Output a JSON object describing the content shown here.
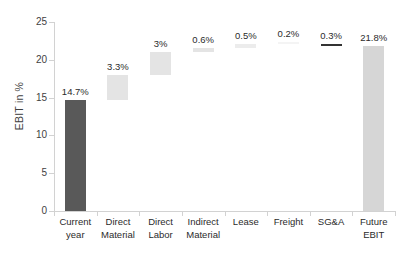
{
  "chart_data": {
    "type": "bar",
    "subtype": "waterfall",
    "title": "",
    "xlabel": "",
    "ylabel": "EBIT in %",
    "ylim": [
      0,
      25
    ],
    "yticks": [
      0,
      5,
      10,
      15,
      20,
      25
    ],
    "ytick_labels": [
      "0",
      "5",
      "10",
      "15",
      "20",
      "25"
    ],
    "grid": false,
    "legend": "none",
    "categories": [
      "Current year",
      "Direct Material",
      "Direct Labor",
      "Indirect Material",
      "Lease",
      "Freight",
      "SG&A",
      "Future EBIT"
    ],
    "category_lines": [
      [
        "Current",
        "year"
      ],
      [
        "Direct",
        "Material"
      ],
      [
        "Direct",
        "Labor"
      ],
      [
        "Indirect",
        "Material"
      ],
      [
        "Lease"
      ],
      [
        "Freight"
      ],
      [
        "SG&A"
      ],
      [
        "Future",
        "EBIT"
      ]
    ],
    "data_labels": [
      "14.7%",
      "3.3%",
      "3%",
      "0.6%",
      "0.5%",
      "0.2%",
      "0.3%",
      "21.8%"
    ],
    "values": [
      14.7,
      3.3,
      3.0,
      0.6,
      0.5,
      0.2,
      -0.3,
      21.8
    ],
    "bars": [
      {
        "category": "Current year",
        "label": "14.7%",
        "value": 14.7,
        "base": 0.0,
        "top": 14.7,
        "kind": "total",
        "color": "#595959"
      },
      {
        "category": "Direct Material",
        "label": "3.3%",
        "value": 3.3,
        "base": 14.7,
        "top": 18.0,
        "kind": "increase",
        "color": "#e4e4e4"
      },
      {
        "category": "Direct Labor",
        "label": "3%",
        "value": 3.0,
        "base": 18.0,
        "top": 21.0,
        "kind": "increase",
        "color": "#e4e4e4"
      },
      {
        "category": "Indirect Material",
        "label": "0.6%",
        "value": 0.6,
        "base": 21.0,
        "top": 21.6,
        "kind": "increase",
        "color": "#e4e4e4"
      },
      {
        "category": "Lease",
        "label": "0.5%",
        "value": 0.5,
        "base": 21.6,
        "top": 22.1,
        "kind": "increase",
        "color": "#ececec"
      },
      {
        "category": "Freight",
        "label": "0.2%",
        "value": 0.2,
        "base": 22.1,
        "top": 22.3,
        "kind": "increase",
        "color": "#f4f4f4"
      },
      {
        "category": "SG&A",
        "label": "0.3%",
        "value": -0.3,
        "base": 21.8,
        "top": 22.1,
        "kind": "decrease",
        "color": "#333333"
      },
      {
        "category": "Future EBIT",
        "label": "21.8%",
        "value": 21.8,
        "base": 0.0,
        "top": 21.8,
        "kind": "total",
        "color": "#d6d6d6"
      }
    ],
    "colors": {
      "current_total_bar": "#595959",
      "increase_bar": "#e4e4e4",
      "decrease_bar": "#333333",
      "future_total_bar": "#d6d6d6",
      "axis": "#d2d2d2",
      "text": "#2b2b2b"
    }
  }
}
